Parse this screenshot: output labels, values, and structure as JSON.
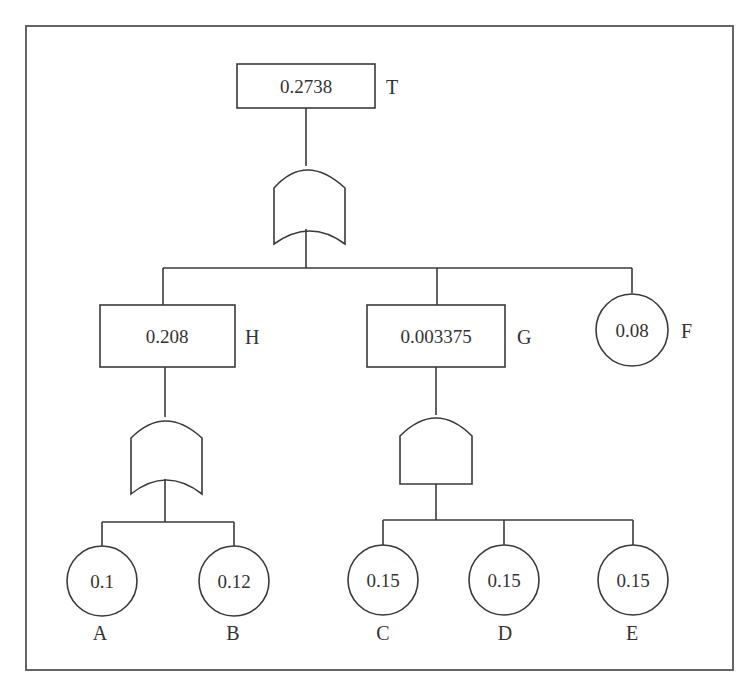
{
  "diagram": {
    "type": "fault-tree",
    "top_event": {
      "id": "T",
      "label": "T",
      "value": "0.2738",
      "gate": "OR"
    },
    "intermediate_events": [
      {
        "id": "H",
        "label": "H",
        "value": "0.208",
        "gate": "OR",
        "children": [
          "A",
          "B"
        ]
      },
      {
        "id": "G",
        "label": "G",
        "value": "0.003375",
        "gate": "AND",
        "children": [
          "C",
          "D",
          "E"
        ]
      }
    ],
    "basic_events": [
      {
        "id": "F",
        "label": "F",
        "value": "0.08"
      },
      {
        "id": "A",
        "label": "A",
        "value": "0.1"
      },
      {
        "id": "B",
        "label": "B",
        "value": "0.12"
      },
      {
        "id": "C",
        "label": "C",
        "value": "0.15"
      },
      {
        "id": "D",
        "label": "D",
        "value": "0.15"
      },
      {
        "id": "E",
        "label": "E",
        "value": "0.15"
      }
    ],
    "top_children": [
      "H",
      "G",
      "F"
    ]
  }
}
